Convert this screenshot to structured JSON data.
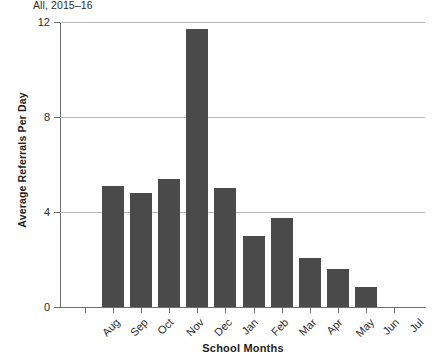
{
  "chart_data": {
    "type": "bar",
    "title": "",
    "subtitle": "All, 2015–16",
    "xlabel": "School Months",
    "ylabel": "Average Referrals Per Day",
    "categories": [
      "Aug",
      "Sep",
      "Oct",
      "Nov",
      "Dec",
      "Jan",
      "Feb",
      "Mar",
      "Apr",
      "May",
      "Jun",
      "Jul"
    ],
    "values": [
      0,
      5.1,
      4.8,
      5.4,
      11.7,
      5.0,
      3.0,
      3.75,
      2.05,
      1.6,
      0.85,
      0
    ],
    "series": [
      {
        "name": "Average Referrals Per Day",
        "values": [
          0,
          5.1,
          4.8,
          5.4,
          11.7,
          5.0,
          3.0,
          3.75,
          2.05,
          1.6,
          0.85,
          0
        ]
      }
    ],
    "ylim": [
      0,
      12
    ],
    "yticks": [
      0,
      4,
      8,
      12
    ],
    "ytick_labels": [
      "0",
      "4",
      "8",
      "12"
    ],
    "grid": "horizontal",
    "legend": "none",
    "bar_color": "#4a4a4a",
    "gridline_color": "#b9b9b9",
    "axis_color": "#6e6e6e",
    "text_color": "#231f20"
  }
}
